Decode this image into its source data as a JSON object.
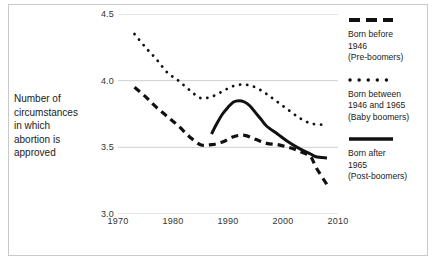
{
  "chart_data": {
    "type": "line",
    "title": "",
    "xlabel": "",
    "ylabel": "Number of circumstances in which abortion is approved",
    "xlim": [
      1970,
      2010
    ],
    "ylim": [
      3.0,
      4.5
    ],
    "xticks": [
      "1970",
      "1980",
      "1990",
      "2000",
      "2010"
    ],
    "yticks": [
      "4.5",
      "4.0",
      "3.5",
      "3.0"
    ],
    "grid": "horizontal",
    "legend_position": "right",
    "series": [
      {
        "name": "Born before 1946 (Pre-boomers)",
        "style": "dashed",
        "color": "#111111",
        "x": [
          1973,
          1975,
          1977,
          1979,
          1981,
          1983,
          1985,
          1987,
          1989,
          1991,
          1993,
          1995,
          1997,
          1999,
          2001,
          2003,
          2005,
          2006,
          2008
        ],
        "y": [
          3.95,
          3.88,
          3.8,
          3.73,
          3.66,
          3.58,
          3.52,
          3.52,
          3.54,
          3.58,
          3.59,
          3.56,
          3.53,
          3.52,
          3.5,
          3.47,
          3.43,
          3.35,
          3.22
        ]
      },
      {
        "name": "Born between 1946 and 1965 (Baby boomers)",
        "style": "dotted",
        "color": "#111111",
        "x": [
          1973,
          1975,
          1977,
          1979,
          1981,
          1983,
          1985,
          1987,
          1989,
          1991,
          1993,
          1995,
          1997,
          1999,
          2001,
          2003,
          2005,
          2007,
          2008
        ],
        "y": [
          4.35,
          4.25,
          4.16,
          4.06,
          4.0,
          3.93,
          3.87,
          3.88,
          3.92,
          3.96,
          3.97,
          3.95,
          3.9,
          3.84,
          3.78,
          3.72,
          3.68,
          3.67,
          3.67
        ]
      },
      {
        "name": "Born after 1965 (Post-boomers)",
        "style": "solid",
        "color": "#111111",
        "x": [
          1987,
          1988,
          1989,
          1990,
          1991,
          1992,
          1993,
          1994,
          1995,
          1996,
          1997,
          1999,
          2001,
          2003,
          2005,
          2006,
          2008
        ],
        "y": [
          3.6,
          3.68,
          3.75,
          3.8,
          3.84,
          3.85,
          3.84,
          3.81,
          3.76,
          3.71,
          3.66,
          3.6,
          3.54,
          3.49,
          3.45,
          3.43,
          3.42
        ]
      }
    ]
  },
  "axis_title": {
    "lines": [
      "Number of",
      "circumstances",
      "in which",
      "abortion is",
      "approved"
    ]
  },
  "legend": {
    "entries": [
      {
        "marker": "dashed-line-marker",
        "lines": [
          "Born before",
          "1946",
          "(Pre-boomers)"
        ]
      },
      {
        "marker": "dotted-line-marker",
        "lines": [
          "Born between",
          "1946 and 1965",
          "(Baby boomers)"
        ]
      },
      {
        "marker": "solid-line-marker",
        "lines": [
          "Born after",
          "1965",
          "(Post-boomers)"
        ]
      }
    ]
  }
}
